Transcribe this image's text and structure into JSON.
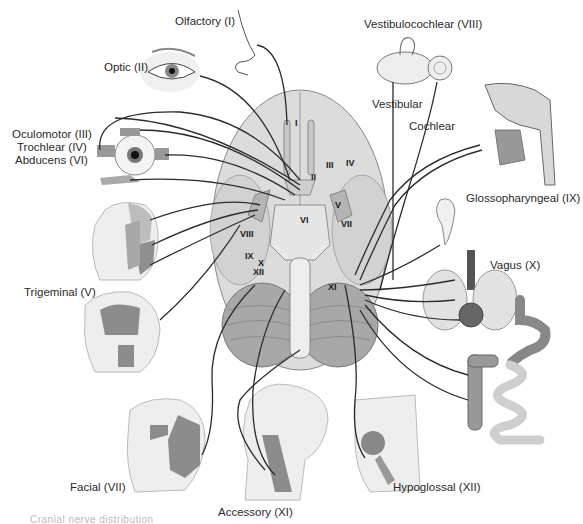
{
  "figure": {
    "caption_partial": "Cranial nerve distribution"
  },
  "labels": {
    "olfactory": "Olfactory (I)",
    "optic": "Optic (II)",
    "oculomotor": "Oculomotor (III)",
    "trochlear": "Trochlear (IV)",
    "abducens": "Abducens (VI)",
    "trigeminal": "Trigeminal (V)",
    "facial": "Facial (VII)",
    "accessory": "Accessory (XI)",
    "hypoglossal": "Hypoglossal (XII)",
    "vagus": "Vagus (X)",
    "glossopharyngeal": "Glossopharyngeal (IX)",
    "vestibulocochlear": "Vestibulocochlear (VIII)",
    "vestibular": "Vestibular",
    "cochlear": "Cochlear"
  },
  "brain_numerals": {
    "I": "I",
    "II": "II",
    "III": "III",
    "IV": "IV",
    "V": "V",
    "VI": "VI",
    "VII": "VII",
    "VIII": "VIII",
    "IX": "IX",
    "X": "X",
    "XI": "XI",
    "XII": "XII"
  },
  "colors": {
    "brain_fill": "#d9d9d9",
    "cerebellum_fill": "#a9a9a9",
    "nerve_line": "#2b2b2b",
    "skin": "#eeeeee",
    "muscle": "#8a8a8a"
  }
}
